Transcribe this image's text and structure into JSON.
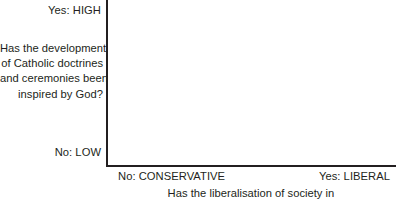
{
  "chart_data": {
    "type": "scatter",
    "title": "",
    "xlabel": "Has the liberalisation of society in",
    "ylabel": "Has the development of Catholic doctrines and ceremonies been inspired by God?",
    "x_tick_labels": [
      "No: CONSERVATIVE",
      "Yes: LIBERAL"
    ],
    "y_tick_labels": [
      "Yes: HIGH",
      "No: LOW"
    ],
    "series": [],
    "x": [],
    "values": [],
    "grid": false,
    "legend": "none",
    "axis_color": "#231f20",
    "background_color": "#ffffff"
  },
  "axes": {
    "y": {
      "top_label": "Yes: HIGH",
      "bottom_label": "No: LOW",
      "title_lines": [
        "Has the development",
        "of Catholic doctrines",
        "and ceremonies been",
        "inspired by God?"
      ]
    },
    "x": {
      "left_label": "No: CONSERVATIVE",
      "right_label": "Yes: LIBERAL",
      "title": "Has the liberalisation of society in"
    }
  }
}
